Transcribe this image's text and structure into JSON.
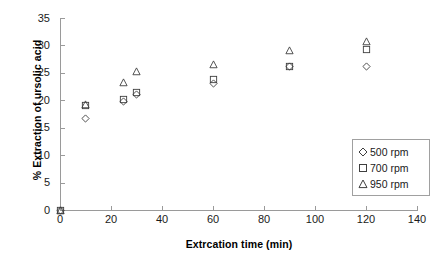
{
  "chart_data": {
    "type": "scatter",
    "title": "",
    "xlabel": "Extrcation time (min)",
    "ylabel": "% Extraction of ursolic acid",
    "xlim": [
      0,
      140
    ],
    "ylim": [
      0,
      35
    ],
    "xticks": [
      0,
      20,
      40,
      60,
      80,
      100,
      120,
      140
    ],
    "yticks": [
      0,
      5,
      10,
      15,
      20,
      25,
      30,
      35
    ],
    "grid": false,
    "legend_position": "center right",
    "series": [
      {
        "name": "500 rpm",
        "marker": "diamond",
        "color": "#3f3f3f",
        "x": [
          0,
          10,
          25,
          30,
          60,
          90,
          120
        ],
        "y": [
          0,
          16.6,
          19.8,
          21.1,
          23.0,
          26.1,
          26.1
        ]
      },
      {
        "name": "700 rpm",
        "marker": "square",
        "color": "#3f3f3f",
        "x": [
          0,
          10,
          25,
          30,
          60,
          90,
          120
        ],
        "y": [
          0,
          19.1,
          20.1,
          21.4,
          23.8,
          26.2,
          29.3
        ]
      },
      {
        "name": "950 rpm",
        "marker": "triangle",
        "color": "#3f3f3f",
        "x": [
          0,
          10,
          25,
          30,
          60,
          90,
          120
        ],
        "y": [
          0,
          19.2,
          23.2,
          25.2,
          26.6,
          29.1,
          30.7
        ]
      }
    ]
  },
  "legend": {
    "entries": [
      {
        "label": "500 rpm",
        "marker": "diamond"
      },
      {
        "label": "700 rpm",
        "marker": "square"
      },
      {
        "label": "950 rpm",
        "marker": "triangle"
      }
    ]
  },
  "axis": {
    "x_title": "Extrcation time (min)",
    "y_title": "% Extraction of ursolic acid",
    "x_tick_labels": [
      "0",
      "20",
      "40",
      "60",
      "80",
      "100",
      "120",
      "140"
    ],
    "y_tick_labels": [
      "0",
      "5",
      "10",
      "15",
      "20",
      "25",
      "30",
      "35"
    ]
  },
  "colors": {
    "marker": "#3f3f3f",
    "axis": "#9a9a9a",
    "text": "#1a1a1a",
    "legend_border": "#a0a0a0",
    "background": "#ffffff"
  }
}
